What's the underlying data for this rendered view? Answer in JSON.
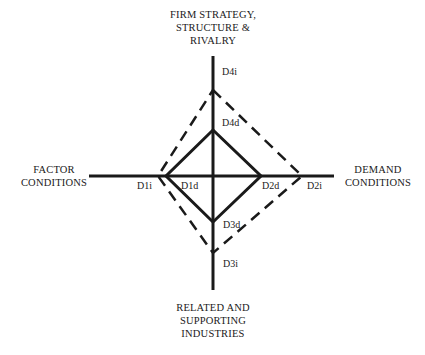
{
  "diagram": {
    "determinants": {
      "top": {
        "line1": "FIRM STRATEGY,",
        "line2": "STRUCTURE &",
        "line3": "RIVALRY"
      },
      "left": {
        "line1": "FACTOR",
        "line2": "CONDITIONS"
      },
      "right": {
        "line1": "DEMAND",
        "line2": "CONDITIONS"
      },
      "bottom": {
        "line1": "RELATED AND",
        "line2": "SUPPORTING",
        "line3": "INDUSTRIES"
      }
    },
    "points": {
      "d1i": "D1i",
      "d1d": "D1d",
      "d2d": "D2d",
      "d2i": "D2i",
      "d3d": "D3d",
      "d3i": "D3i",
      "d4d": "D4d",
      "d4i": "D4i"
    },
    "series": [
      {
        "name": "direct diamond",
        "style": "solid",
        "color": "#1a1a1a"
      },
      {
        "name": "indirect diamond",
        "style": "dashed",
        "color": "#1a1a1a"
      }
    ]
  }
}
